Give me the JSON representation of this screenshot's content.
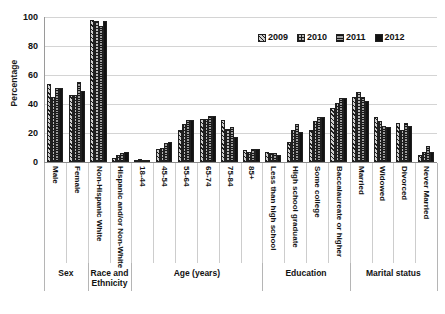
{
  "chart_data": {
    "type": "bar",
    "title": "",
    "xlabel": "",
    "ylabel": "Percentage",
    "ylim": [
      0,
      100
    ],
    "yticks": [
      0,
      20,
      40,
      60,
      80,
      100
    ],
    "grid": true,
    "legend_position": "top-right",
    "categories": [
      "Male",
      "Female",
      "Non-Hispanic White",
      "Hispanic and/or Non-White",
      "18-44",
      "45-54",
      "55-64",
      "65-74",
      "75-84",
      "85+",
      "Less than high school",
      "High school graduate",
      "Some college",
      "Baccalaureate or higher",
      "Married",
      "Widowed",
      "Divorced",
      "Never Married"
    ],
    "groups": [
      {
        "label": "Sex",
        "span": 2
      },
      {
        "label": "Race and Ethnicity",
        "span": 2
      },
      {
        "label": "Age (years)",
        "span": 6
      },
      {
        "label": "Education",
        "span": 4
      },
      {
        "label": "Marital status",
        "span": 4
      }
    ],
    "series": [
      {
        "name": "2009",
        "pattern": "diagonal-hatch",
        "values": [
          54,
          46,
          98,
          3,
          1,
          9,
          22,
          30,
          29,
          8,
          7,
          14,
          22,
          37,
          45,
          31,
          27,
          5
        ]
      },
      {
        "name": "2010",
        "pattern": "grid-hatch",
        "values": [
          45,
          46,
          97,
          5,
          2,
          10,
          26,
          30,
          23,
          7,
          6,
          22,
          28,
          41,
          48,
          28,
          22,
          7
        ]
      },
      {
        "name": "2011",
        "pattern": "horizontal-lines",
        "values": [
          51,
          55,
          94,
          6,
          1,
          13,
          29,
          32,
          24,
          9,
          6,
          26,
          31,
          44,
          45,
          25,
          27,
          11
        ]
      },
      {
        "name": "2012",
        "pattern": "solid",
        "values": [
          51,
          49,
          97,
          7,
          1,
          14,
          29,
          32,
          17,
          9,
          5,
          21,
          31,
          44,
          42,
          24,
          25,
          7
        ]
      }
    ]
  },
  "legend": {
    "items": [
      {
        "label": "2009"
      },
      {
        "label": "2010"
      },
      {
        "label": "2011"
      },
      {
        "label": "2012"
      }
    ]
  },
  "colors": {
    "series_2009": "#cfcfcf",
    "series_2010": "#b9b9b9",
    "series_2011": "#9c9c9c",
    "series_2012": "#121212",
    "grid": "#d4d4d4",
    "axis": "#8e8e8e",
    "text": "#121212"
  }
}
